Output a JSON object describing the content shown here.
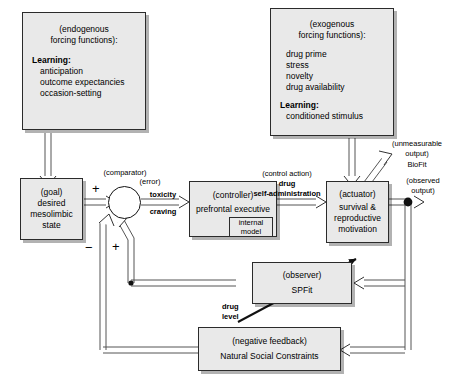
{
  "diagram": {
    "colors": {
      "box_fill": "#e9e9e9",
      "box_stroke": "#2b2b2b",
      "wire": "#555555",
      "text": "#000000"
    },
    "nodes": {
      "endogenous": {
        "header": "(endogenous\nforcing functions):",
        "section_label": "Learning:",
        "items": [
          "anticipation",
          "outcome expectancies",
          "occasion-setting"
        ]
      },
      "exogenous": {
        "header": "(exogenous\nforcing functions):",
        "items": [
          "drug prime",
          "stress",
          "novelty",
          "drug availability"
        ],
        "section_label": "Learning:",
        "sub_items": [
          "conditioned stimulus"
        ]
      },
      "goal": {
        "role": "(goal)",
        "name": "desired\nmesolimbic\nstate"
      },
      "comparator": {
        "role": "(comparator)"
      },
      "controller": {
        "role": "(controller)",
        "name": "prefrontal executive",
        "internal_model": "internal\nmodel"
      },
      "actuator": {
        "role": "(actuator)",
        "name": "survival &\nreproductive\nmotivation"
      },
      "observer": {
        "role": "(observer)",
        "name": "SPFit"
      },
      "negative_feedback": {
        "role": "(negative feedback)",
        "name": "Natural Social Constraints"
      }
    },
    "signals": {
      "error_role": "(error)",
      "error_a": "toxicity",
      "error_b": "craving",
      "control_action_role": "(control action)",
      "control_action_name": "drug\nself-administration",
      "unmeasurable_role": "(unmeasurable\noutput)",
      "unmeasurable_name": "BioFit",
      "observed_role": "(observed\noutput)",
      "drug_level": "drug\nlevel",
      "plus_goal": "+",
      "minus_feedback": "−",
      "plus_observer": "+"
    }
  }
}
